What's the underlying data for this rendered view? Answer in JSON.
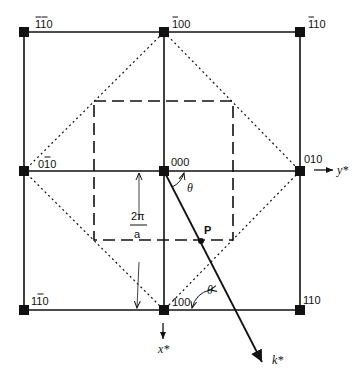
{
  "figure": {
    "type": "reciprocal lattice diagram",
    "nodes": [
      {
        "id": "n-110bb",
        "label": "110",
        "bars": [
          0,
          1
        ],
        "x": 24,
        "y": 32
      },
      {
        "id": "n-100b",
        "label": "100",
        "bars": [
          0
        ],
        "x": 164,
        "y": 32
      },
      {
        "id": "n-110b1",
        "label": "110",
        "bars": [
          0
        ],
        "x": 300,
        "y": 32
      },
      {
        "id": "n-010b",
        "label": "010",
        "bars": [
          1
        ],
        "x": 24,
        "y": 171
      },
      {
        "id": "n-000",
        "label": "000",
        "bars": [],
        "x": 164,
        "y": 171
      },
      {
        "id": "n-010",
        "label": "010",
        "bars": [],
        "x": 300,
        "y": 171
      },
      {
        "id": "n-110b2",
        "label": "110",
        "bars": [
          1
        ],
        "x": 24,
        "y": 310
      },
      {
        "id": "n-100",
        "label": "100",
        "bars": [],
        "x": 164,
        "y": 310
      },
      {
        "id": "n-110",
        "label": "110",
        "bars": [],
        "x": 300,
        "y": 310
      }
    ],
    "axes": {
      "y_axis_label": "y*",
      "x_axis_label": "x*",
      "k_vector_label": "k*"
    },
    "annotations": {
      "point_label": "P",
      "angle_label": "θ",
      "dimension_numerator": "2π",
      "dimension_denominator": "a"
    },
    "colors": {
      "line": "#111111",
      "background": "#ffffff"
    }
  }
}
